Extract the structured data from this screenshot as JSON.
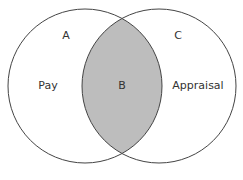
{
  "diagram": {
    "type": "venn",
    "sets": [
      {
        "region": "A",
        "label": "Pay"
      },
      {
        "region": "C",
        "label": "Appraisal"
      }
    ],
    "intersection": {
      "region": "B"
    },
    "colors": {
      "stroke": "#444444",
      "intersection_fill": "#bdbdbd",
      "background": "#ffffff"
    }
  },
  "labels": {
    "a": "A",
    "b": "B",
    "c": "C",
    "pay": "Pay",
    "appraisal": "Appraisal"
  }
}
